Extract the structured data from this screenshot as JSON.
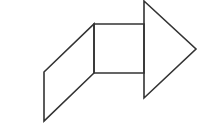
{
  "diagram": {
    "stroke_color": "#333333",
    "background": "#ffffff",
    "stroke_width": 1.6,
    "shapes": [
      {
        "name": "parallelogram",
        "points": [
          [
            44,
            72
          ],
          [
            94,
            24
          ],
          [
            94,
            73
          ],
          [
            44,
            121
          ]
        ]
      },
      {
        "name": "square",
        "points": [
          [
            94,
            24
          ],
          [
            144,
            24
          ],
          [
            144,
            73
          ],
          [
            94,
            73
          ]
        ]
      },
      {
        "name": "triangle-arrowhead",
        "points": [
          [
            144,
            1
          ],
          [
            196,
            49
          ],
          [
            144,
            98
          ]
        ]
      }
    ]
  }
}
